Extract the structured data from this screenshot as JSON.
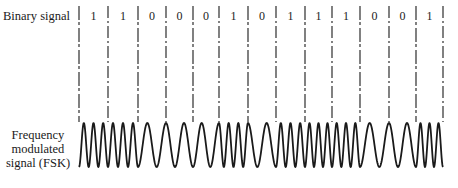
{
  "labels": {
    "binary_signal": "Binary signal",
    "fsk_signal_lines": [
      "Frequency",
      "modulated",
      "signal (FSK)"
    ]
  },
  "bits": [
    1,
    1,
    0,
    0,
    0,
    1,
    0,
    1,
    1,
    1,
    0,
    0,
    1
  ],
  "bit_labels": [
    "1",
    "1",
    "0",
    "0",
    "0",
    "1",
    "0",
    "1",
    "1",
    "1",
    "0",
    "0",
    "1"
  ],
  "boundaries_x": [
    79,
    108,
    138,
    166,
    193,
    219,
    248,
    276,
    305,
    332,
    360,
    389,
    416,
    443
  ],
  "modulation": {
    "cycles_per_one": 3,
    "cycles_per_zero": 1.5,
    "wave_top_y": 123,
    "wave_bottom_y": 167
  },
  "colors": {
    "ink": "#1a1a1a",
    "background": "#ffffff"
  }
}
